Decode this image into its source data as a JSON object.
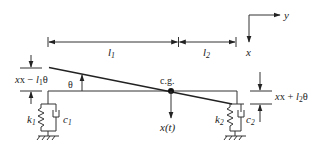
{
  "diagram": {
    "type": "vehicle-pitch-bounce-model",
    "axes": {
      "horizontal": "y",
      "vertical": "x"
    },
    "dimensions": {
      "left_length": {
        "symbol": "l",
        "subscript": "1"
      },
      "right_length": {
        "symbol": "l",
        "subscript": "2"
      }
    },
    "labels": {
      "cg": "c.g.",
      "theta": "θ",
      "displacement": "x(t)",
      "left_deflection": {
        "pre": "x − ",
        "sym": "l",
        "sub": "1",
        "post": "θ"
      },
      "right_deflection": {
        "pre": "x + ",
        "sym": "l",
        "sub": "2",
        "post": "θ"
      }
    },
    "left_support": {
      "spring": {
        "symbol": "k",
        "subscript": "1"
      },
      "damper": {
        "symbol": "c",
        "subscript": "1"
      }
    },
    "right_support": {
      "spring": {
        "symbol": "k",
        "subscript": "2"
      },
      "damper": {
        "symbol": "c",
        "subscript": "2"
      }
    },
    "colors": {
      "stroke": "#333333",
      "background": "#ffffff"
    }
  }
}
